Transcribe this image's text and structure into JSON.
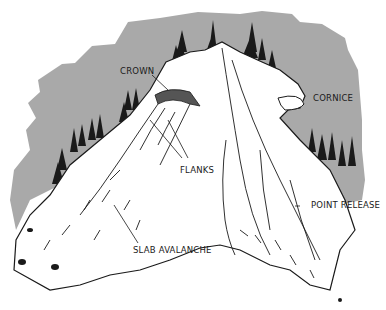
{
  "diagram": {
    "colors": {
      "sky_background": "#a9a9a9",
      "snow": "#ffffff",
      "ink": "#1a1a1a",
      "page": "#ffffff"
    },
    "labels": [
      {
        "id": "crown",
        "text": "CROWN"
      },
      {
        "id": "cornice",
        "text": "CORNICE"
      },
      {
        "id": "flanks",
        "text": "FLANKS"
      },
      {
        "id": "point_release",
        "text": "POINT RELEASE"
      },
      {
        "id": "slab_avalanche",
        "text": "SLAB AVALANCHE"
      }
    ]
  }
}
